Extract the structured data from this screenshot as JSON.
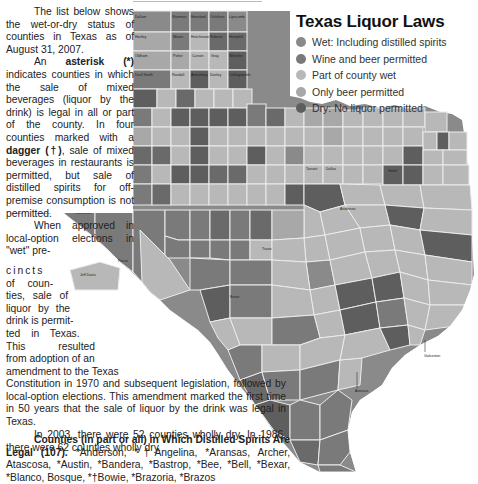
{
  "legend": {
    "title": "Texas Liquor Laws",
    "items": [
      {
        "label": "Wet: Including distilled spirits",
        "color": "#8a8a8a"
      },
      {
        "label": "Wine and beer permitted",
        "color": "#7a7a7a"
      },
      {
        "label": "Part of county wet",
        "color": "#b8b8b8"
      },
      {
        "label": "Only beer permitted",
        "color": "#a8a8a8"
      },
      {
        "label": "Dry: No liquor permitted",
        "color": "#5e5e5e"
      }
    ]
  },
  "article": {
    "p1": "The list below shows the wet-or-dry status of counties in Texas as of August 31, 2007.",
    "p2_pre": "An ",
    "p2_bold1": "asterisk (*)",
    "p2_mid": " indicates counties in which the sale of mixed beverages (liquor by the drink) is legal in all or part of the county. In four counties marked with a ",
    "p2_bold2": "dagger (†)",
    "p2_post": ", sale of mixed beverages in restaurants is permitted, but sale of distilled spirits for off-premise consumption is not permitted.",
    "p3_start": "When approved in local-option elections in \"wet\" pre-",
    "p3_lines": [
      "cincts",
      "of coun-",
      "ties, sale of",
      "liquor by the",
      "drink is permit-",
      "ted in Texas.",
      "This resulted",
      "from adoption of an",
      "amendment to the Texas"
    ],
    "p3_wide": "Constitution in 1970 and subsequent legislation, followed by local-option elections. This amendment marked the first time in 50 years that the sale of liquor by the drink was legal in Texas.",
    "p4": "In 2003, there were 52 counties wholly dry. In 1986, there were 62 counties wholly dry.",
    "list_heading": "Counties (in part or all) in Which Distilled Spirits Are Legal (107).",
    "list_text": " *Anderson, *†Angelina, *Aransas, Archer, Atascosa, *Austin, *Bandera, *Bastrop, *Bee, *Bell, *Bexar, *Blanco, Bosque, *†Bowie, *Brazoria, *Brazos"
  },
  "map": {
    "colors": {
      "wet": "#8a8a8a",
      "wine": "#7a7a7a",
      "part": "#b8b8b8",
      "beer": "#a8a8a8",
      "dry": "#5e5e5e",
      "border": "#e8e8e8"
    },
    "panhandle_counties": [
      [
        "Dallam",
        "Sherman",
        "Hansford",
        "Ochiltree",
        "Lipscomb"
      ],
      [
        "Hartley",
        "Moore",
        "Hutchinson",
        "Roberts",
        "Hemphill"
      ],
      [
        "Oldham",
        "Potter",
        "Carson",
        "Gray",
        "Wheeler"
      ],
      [
        "Deaf Smith",
        "Randall",
        "Armstrong",
        "Donley",
        "Collingsworth"
      ],
      [
        "Parmer",
        "Castro",
        "Swisher",
        "Briscoe",
        "Hall",
        "Childress"
      ],
      [
        "Bailey",
        "Lamb",
        "Hale",
        "Floyd",
        "Motley",
        "Cottle",
        "Foard",
        "Wilbarger",
        "Wichita"
      ],
      [
        "Cochran",
        "Hockley",
        "Lubbock",
        "Crosby",
        "Dickens",
        "King",
        "Knox",
        "Baylor",
        "Archer"
      ],
      [
        "Yoakum",
        "Terry",
        "Lynn",
        "Garza",
        "Kent",
        "Stonewall",
        "Haskell",
        "Throckmorton",
        "Young"
      ],
      [
        "Gaines",
        "Dawson",
        "Borden",
        "Scurry",
        "Fisher",
        "Jones",
        "Shackelford",
        "Stephens",
        "Palo Pinto"
      ],
      [
        "Andrews",
        "Martin",
        "Howard",
        "Mitchell",
        "Nolan",
        "Taylor",
        "Callahan",
        "Eastland",
        "Erath"
      ]
    ],
    "other_labels": [
      "El Paso",
      "Hudspeth",
      "Culberson",
      "Loving",
      "Winkler",
      "Ector",
      "Midland",
      "Glasscock",
      "Reeves",
      "Ward",
      "Crane",
      "Upton",
      "Reagan",
      "Jeff Davis",
      "Pecos",
      "Presidio",
      "Brewster",
      "Terrell",
      "Val Verde",
      "Crockett",
      "Sutton",
      "Schleicher",
      "Menard",
      "Irion",
      "Tom Green",
      "Coke",
      "Sterling",
      "Runnels",
      "Coleman",
      "Brown",
      "Comanche",
      "Mills",
      "Hamilton",
      "McCulloch",
      "San Saba",
      "Lampasas",
      "Mason",
      "Llano",
      "Burnet",
      "Kimble",
      "Gillespie",
      "Edwards",
      "Kerr",
      "Real",
      "Bandera",
      "Kinney",
      "Uvalde",
      "Medina",
      "Maverick",
      "Zavala",
      "Frio",
      "Atascosa",
      "Dimmit",
      "La Salle",
      "McMullen",
      "Live Oak",
      "Webb",
      "Duval",
      "Jim Wells",
      "Zapata",
      "Jim Hogg",
      "Brooks",
      "Kleberg",
      "Starr",
      "Hidalgo",
      "Willacy",
      "Cameron",
      "Kenedy",
      "Nueces",
      "San Patricio",
      "Refugio",
      "Aransas",
      "Bee",
      "Goliad",
      "Victoria",
      "Calhoun",
      "Jackson",
      "Matagorda",
      "Wharton",
      "Brazoria",
      "Galveston",
      "Harris",
      "Fort Bend",
      "Montague",
      "Cooke",
      "Grayson",
      "Fannin",
      "Lamar",
      "Red River",
      "Bowie",
      "Jack",
      "Wise",
      "Denton",
      "Collin",
      "Hunt",
      "Delta",
      "Hopkins",
      "Franklin",
      "Titus",
      "Morris",
      "Cass",
      "Parker",
      "Tarrant",
      "Dallas",
      "Rockwall",
      "Kaufman",
      "Van Zandt",
      "Wood",
      "Upshur",
      "Marion",
      "Harrison",
      "Hood",
      "Johnson",
      "Ellis",
      "Henderson",
      "Smith",
      "Gregg",
      "Rusk",
      "Panola",
      "Somervell",
      "Bosque",
      "Hill",
      "Navarro",
      "Anderson",
      "Cherokee",
      "Nacogdoches",
      "Shelby",
      "Limestone",
      "Freestone",
      "Houston",
      "Trinity",
      "Angelina",
      "San Augustine",
      "Sabine",
      "Polk",
      "Tyler",
      "Jasper",
      "Newton",
      "Walker",
      "San Jacinto",
      "Liberty",
      "Hardin",
      "Orange",
      "Jefferson",
      "Chambers",
      "Montgomery",
      "Grimes",
      "Madison",
      "Leon",
      "Robertson",
      "Brazos",
      "Burleson",
      "Milam",
      "Falls",
      "McLennan",
      "Bell",
      "Coryell",
      "Williamson",
      "Travis",
      "Hays",
      "Comal",
      "Guadalupe",
      "Caldwell",
      "Bastrop",
      "Lee",
      "Fayette",
      "Austin",
      "Washington",
      "Waller",
      "Colorado",
      "Lavaca",
      "DeWitt",
      "Gonzales",
      "Wilson",
      "Karnes",
      "Bexar",
      "Kendall",
      "Blanco"
    ],
    "city_labels": [
      "Galveston",
      "Aransas"
    ]
  }
}
